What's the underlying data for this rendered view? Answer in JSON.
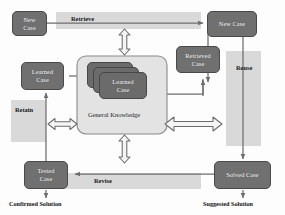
{
  "diagram": {
    "nodes": {
      "new_case_left": "New\nCase",
      "new_case_right": "New Case",
      "retrieved_case": "Retrieved\nCase",
      "learned_case_left": "Learned\nCase",
      "learned_case_stack": "Learned\nCase",
      "tested_case": "Tested\nCase",
      "solved_case": "Solved Case"
    },
    "process_labels": {
      "retrieve": "Retrieve",
      "reuse": "Reuse",
      "revise": "Revise",
      "retain": "Retain"
    },
    "container_label": "General Knowledge",
    "outputs": {
      "confirmed_solution": "Confirmed Solution",
      "suggested_solution": "Suggested Solution"
    },
    "colors": {
      "node_fill": "#707070",
      "node_stroke": "#4a4a4a",
      "band_fill": "#d2d2d2",
      "container_fill": "#e3e3e3",
      "container_stroke": "#8a8a8a",
      "connector": "#6e6e6e",
      "hollow_arrow_fill": "#f5f5f5",
      "hollow_arrow_stroke": "#6b6b6b",
      "text_dark": "#111111",
      "text_light": "#ffffff"
    }
  }
}
